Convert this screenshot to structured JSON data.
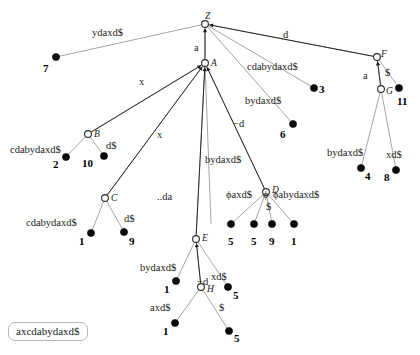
{
  "figure": {
    "kind": "suffix-tree-diagram",
    "string_box": "axcdabydaxd$",
    "colors": {
      "edge": "#9a9a9a",
      "suffix_link": "#1a1a1a",
      "leaf": "#0a0a0a",
      "internal_node_fill": "#ffffff",
      "text": "#1a1a1a"
    }
  },
  "nodes": [
    {
      "id": "Z",
      "label": "Z",
      "x": 205,
      "y": 24,
      "type": "internal",
      "name_dx": 0,
      "name_dy": -12
    },
    {
      "id": "A",
      "label": "A",
      "x": 205,
      "y": 63,
      "type": "internal",
      "name_dx": 6,
      "name_dy": -4
    },
    {
      "id": "B",
      "label": "B",
      "x": 88,
      "y": 134,
      "type": "internal",
      "name_dx": 6,
      "name_dy": -4
    },
    {
      "id": "C",
      "label": "C",
      "x": 105,
      "y": 198,
      "type": "internal",
      "name_dx": 6,
      "name_dy": -4
    },
    {
      "id": "D",
      "label": "D",
      "x": 266,
      "y": 192,
      "type": "internal",
      "name_dx": 6,
      "name_dy": -6
    },
    {
      "id": "E",
      "label": "E",
      "x": 196,
      "y": 239,
      "type": "internal",
      "name_dx": 6,
      "name_dy": -5
    },
    {
      "id": "F",
      "label": "F",
      "x": 377,
      "y": 57,
      "type": "internal",
      "name_dx": 4,
      "name_dy": -7
    },
    {
      "id": "G",
      "label": "G",
      "x": 381,
      "y": 89,
      "type": "internal",
      "name_dx": 5,
      "name_dy": -2
    },
    {
      "id": "H",
      "label": "H",
      "x": 201,
      "y": 287,
      "type": "internal",
      "name_dx": 6,
      "name_dy": -2
    }
  ],
  "leaves": [
    {
      "id": "L7",
      "num": "7",
      "x": 56,
      "y": 57,
      "num_dx": -13,
      "num_dy": 6
    },
    {
      "id": "L3",
      "num": "3",
      "x": 314,
      "y": 88,
      "num_dx": 5,
      "num_dy": -4
    },
    {
      "id": "L6",
      "num": "6",
      "x": 293,
      "y": 124,
      "num_dx": -13,
      "num_dy": 5
    },
    {
      "id": "L11",
      "num": "11",
      "x": 399,
      "y": 88,
      "num_dx": -2,
      "num_dy": 8
    },
    {
      "id": "L2",
      "num": "2",
      "x": 66,
      "y": 157,
      "num_dx": -13,
      "num_dy": 2
    },
    {
      "id": "L10",
      "num": "10",
      "x": 104,
      "y": 156,
      "num_dx": -22,
      "num_dy": 2
    },
    {
      "id": "L4",
      "num": "4",
      "x": 361,
      "y": 168,
      "num_dx": 4,
      "num_dy": 3
    },
    {
      "id": "L8",
      "num": "8",
      "x": 396,
      "y": 170,
      "num_dx": -12,
      "num_dy": 2
    },
    {
      "id": "L1c",
      "num": "1",
      "x": 91,
      "y": 233,
      "num_dx": -12,
      "num_dy": 3
    },
    {
      "id": "L9c",
      "num": "9",
      "x": 124,
      "y": 232,
      "num_dx": 5,
      "num_dy": 4
    },
    {
      "id": "L5a",
      "num": "5",
      "x": 231,
      "y": 224,
      "num_dx": -3,
      "num_dy": 12
    },
    {
      "id": "L5b",
      "num": "5",
      "x": 254,
      "y": 224,
      "num_dx": -3,
      "num_dy": 12
    },
    {
      "id": "L9d",
      "num": "9",
      "x": 272,
      "y": 224,
      "num_dx": -3,
      "num_dy": 12
    },
    {
      "id": "L1d",
      "num": "1",
      "x": 294,
      "y": 224,
      "num_dx": -3,
      "num_dy": 12
    },
    {
      "id": "L1e",
      "num": "1",
      "x": 176,
      "y": 281,
      "num_dx": -12,
      "num_dy": 3
    },
    {
      "id": "L5e",
      "num": "5",
      "x": 228,
      "y": 287,
      "num_dx": 5,
      "num_dy": 3
    },
    {
      "id": "L1h",
      "num": "1",
      "x": 175,
      "y": 323,
      "num_dx": -12,
      "num_dy": 3
    },
    {
      "id": "L5h",
      "num": "5",
      "x": 229,
      "y": 331,
      "num_dx": 5,
      "num_dy": 2
    }
  ],
  "edges": [
    {
      "from": "Z",
      "to": "L7",
      "label": "ydaxd$",
      "lx": 92,
      "ly": 28
    },
    {
      "from": "Z",
      "to": "A",
      "label": "a",
      "lx": 194,
      "ly": 43
    },
    {
      "from": "Z",
      "to": "L3",
      "label": "cdabydaxd$",
      "lx": 247,
      "ly": 62
    },
    {
      "from": "Z",
      "to": "L6",
      "label": "bydaxd$",
      "lx": 245,
      "ly": 96
    },
    {
      "from": "Z",
      "to": "F",
      "label": "d",
      "lx": 283,
      "ly": 30
    },
    {
      "from": "A",
      "to": "B",
      "label": "x",
      "lx": 139,
      "ly": 77
    },
    {
      "from": "A",
      "to": "C",
      "label": "x",
      "lx": 157,
      "ly": 130
    },
    {
      "from": "A",
      "to": "E",
      "label": "..da",
      "lx": 157,
      "ly": 192
    },
    {
      "from": "A",
      "to": "L1e2",
      "label": "bydaxd$",
      "lx": 205,
      "ly": 155
    },
    {
      "from": "A",
      "to": "D",
      "label": "−d",
      "lx": 233,
      "ly": 119
    },
    {
      "from": "B",
      "to": "L2",
      "label": "cdabydaxd$",
      "lx": 10,
      "ly": 145
    },
    {
      "from": "B",
      "to": "L10",
      "label": "d$",
      "lx": 106,
      "ly": 141
    },
    {
      "from": "C",
      "to": "L1c",
      "label": "cdabydaxd$",
      "lx": 26,
      "ly": 218
    },
    {
      "from": "C",
      "to": "L9c",
      "label": "d$",
      "lx": 124,
      "ly": 214
    },
    {
      "from": "D",
      "to": "L5a",
      "label": "ϕaxd$",
      "lx": 226,
      "ly": 190
    },
    {
      "from": "D",
      "to": "L5b",
      "label": "ϕ",
      "lx": 263,
      "ly": 190
    },
    {
      "from": "D",
      "to": "L9d",
      "label": "$",
      "lx": 266,
      "ly": 202
    },
    {
      "from": "D",
      "to": "L1d",
      "label": "ϕabydaxd$",
      "lx": 273,
      "ly": 190
    },
    {
      "from": "E",
      "to": "L1e",
      "label": "bydaxd$",
      "lx": 140,
      "ly": 263
    },
    {
      "from": "E",
      "to": "H",
      "label": "−d",
      "lx": 197,
      "ly": 277
    },
    {
      "from": "E",
      "to": "L5e",
      "label": "xd$",
      "lx": 211,
      "ly": 272
    },
    {
      "from": "H",
      "to": "L1h",
      "label": "axd$",
      "lx": 150,
      "ly": 303
    },
    {
      "from": "H",
      "to": "L5h",
      "label": "$",
      "lx": 219,
      "ly": 303
    },
    {
      "from": "F",
      "to": "G",
      "label": "a",
      "lx": 363,
      "ly": 71
    },
    {
      "from": "F",
      "to": "L11",
      "label": "$",
      "lx": 385,
      "ly": 68
    },
    {
      "from": "G",
      "to": "L4",
      "label": "bydaxd$",
      "lx": 327,
      "ly": 148
    },
    {
      "from": "G",
      "to": "L8",
      "label": "xd$",
      "lx": 386,
      "ly": 150
    }
  ],
  "suffix_links": [
    {
      "from": "A",
      "to": "Z"
    },
    {
      "from": "B",
      "to": "A"
    },
    {
      "from": "C",
      "to": "A"
    },
    {
      "from": "D",
      "to": "A"
    },
    {
      "from": "E",
      "to": "A"
    },
    {
      "from": "F",
      "to": "Z"
    },
    {
      "from": "G",
      "to": "F"
    },
    {
      "from": "H",
      "to": "E"
    }
  ]
}
